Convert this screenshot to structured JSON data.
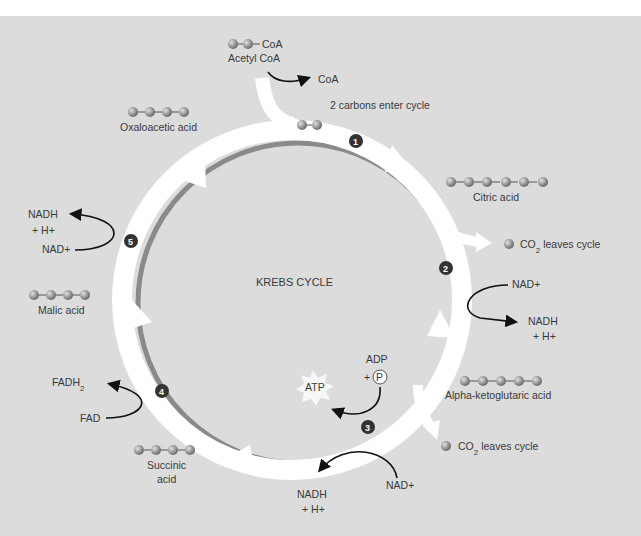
{
  "diagram": {
    "title": "KREBS CYCLE",
    "colors": {
      "background": "#dcdcdc",
      "ring_arrow": "#ffffff",
      "ring_shadow": "#8a8a8a",
      "carbon_ball": "#9a9a9a",
      "step_badge": "#333333",
      "text": "#3a3a3a",
      "arrow_line": "#111111"
    },
    "entry": {
      "acetyl_coa_formula": "CoA",
      "acetyl_coa_label": "Acetyl CoA",
      "coa_released": "CoA",
      "note": "2 carbons enter cycle"
    },
    "molecules": [
      {
        "name": "Oxaloacetic acid",
        "carbons": 4
      },
      {
        "name": "Citric acid",
        "carbons": 6
      },
      {
        "name": "Alpha-ketoglutaric acid",
        "carbons": 5
      },
      {
        "name": "Succinic acid",
        "line1": "Succinic",
        "line2": "acid",
        "carbons": 4
      },
      {
        "name": "Malic acid",
        "carbons": 4
      }
    ],
    "steps": [
      {
        "number": "1"
      },
      {
        "number": "2",
        "input": "NAD+",
        "output_line1": "NADH",
        "output_line2": "+ H+",
        "co2": "leaves cycle",
        "co2_label": "CO"
      },
      {
        "number": "3",
        "input": "NAD+",
        "output_line1": "NADH",
        "output_line2": "+ H+",
        "co2": "leaves cycle",
        "co2_label": "CO",
        "adp": "ADP",
        "plus": "+",
        "phosphate": "P",
        "atp": "ATP"
      },
      {
        "number": "4",
        "input": "FAD",
        "output": "FADH",
        "output_sub": "2"
      },
      {
        "number": "5",
        "input": "NAD+",
        "output_line1": "NADH",
        "output_line2": "+ H+"
      }
    ]
  }
}
